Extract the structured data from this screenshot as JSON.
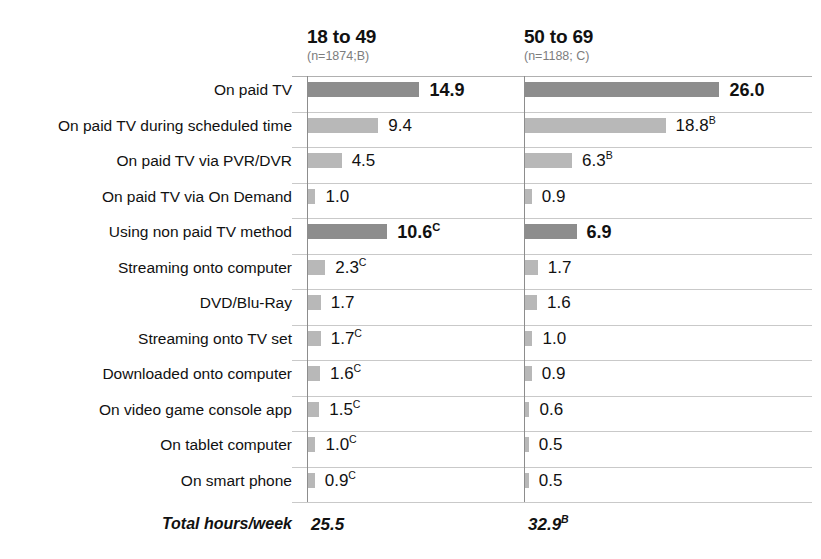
{
  "chart_data": {
    "type": "bar",
    "title": "",
    "subtitle": "",
    "xlabel": "",
    "ylabel": "",
    "orientation": "horizontal",
    "grid": true,
    "legend_position": "none",
    "xlim": [
      0,
      27
    ],
    "columns": [
      {
        "key": "B",
        "title": "18 to 49",
        "nsize": "(n=1874;B)"
      },
      {
        "key": "C",
        "title": "50 to 69",
        "nsize": "(n=1188; C)"
      }
    ],
    "categories": [
      "On paid TV",
      "On paid TV during scheduled time",
      "On paid TV via PVR/DVR",
      "On paid TV via On Demand",
      "Using non paid TV method",
      "Streaming onto computer",
      "DVD/Blu-Ray",
      "Streaming onto TV set",
      "Downloaded onto computer",
      "On video game console app",
      "On tablet computer",
      "On smart phone"
    ],
    "rows": [
      {
        "label": "On paid TV",
        "emphasis": true,
        "col1": {
          "value": 14.9,
          "text": "14.9",
          "sig": "",
          "bold": true,
          "shade": "dark"
        },
        "col2": {
          "value": 26.0,
          "text": "26.0",
          "sig": "",
          "bold": true,
          "shade": "dark"
        }
      },
      {
        "label": "On paid TV during scheduled time",
        "emphasis": false,
        "col1": {
          "value": 9.4,
          "text": "9.4",
          "sig": "",
          "bold": false,
          "shade": "light"
        },
        "col2": {
          "value": 18.8,
          "text": "18.8",
          "sig": "B",
          "bold": false,
          "shade": "light"
        }
      },
      {
        "label": "On paid TV via PVR/DVR",
        "emphasis": false,
        "col1": {
          "value": 4.5,
          "text": "4.5",
          "sig": "",
          "bold": false,
          "shade": "light"
        },
        "col2": {
          "value": 6.3,
          "text": "6.3",
          "sig": "B",
          "bold": false,
          "shade": "light"
        }
      },
      {
        "label": "On paid TV via On Demand",
        "emphasis": false,
        "col1": {
          "value": 1.0,
          "text": "1.0",
          "sig": "",
          "bold": false,
          "shade": "light"
        },
        "col2": {
          "value": 0.9,
          "text": "0.9",
          "sig": "",
          "bold": false,
          "shade": "light"
        }
      },
      {
        "label": "Using non paid TV method",
        "emphasis": true,
        "col1": {
          "value": 10.6,
          "text": "10.6",
          "sig": "C",
          "bold": true,
          "shade": "dark"
        },
        "col2": {
          "value": 6.9,
          "text": "6.9",
          "sig": "",
          "bold": true,
          "shade": "dark"
        }
      },
      {
        "label": "Streaming onto computer",
        "emphasis": false,
        "col1": {
          "value": 2.3,
          "text": "2.3",
          "sig": "C",
          "bold": false,
          "shade": "light"
        },
        "col2": {
          "value": 1.7,
          "text": "1.7",
          "sig": "",
          "bold": false,
          "shade": "light"
        }
      },
      {
        "label": "DVD/Blu-Ray",
        "emphasis": false,
        "col1": {
          "value": 1.7,
          "text": "1.7",
          "sig": "",
          "bold": false,
          "shade": "light"
        },
        "col2": {
          "value": 1.6,
          "text": "1.6",
          "sig": "",
          "bold": false,
          "shade": "light"
        }
      },
      {
        "label": "Streaming onto TV set",
        "emphasis": false,
        "col1": {
          "value": 1.7,
          "text": "1.7",
          "sig": "C",
          "bold": false,
          "shade": "light"
        },
        "col2": {
          "value": 1.0,
          "text": "1.0",
          "sig": "",
          "bold": false,
          "shade": "light"
        }
      },
      {
        "label": "Downloaded onto computer",
        "emphasis": false,
        "col1": {
          "value": 1.6,
          "text": "1.6",
          "sig": "C",
          "bold": false,
          "shade": "light"
        },
        "col2": {
          "value": 0.9,
          "text": "0.9",
          "sig": "",
          "bold": false,
          "shade": "light"
        }
      },
      {
        "label": "On video game console app",
        "emphasis": false,
        "col1": {
          "value": 1.5,
          "text": "1.5",
          "sig": "C",
          "bold": false,
          "shade": "light"
        },
        "col2": {
          "value": 0.6,
          "text": "0.6",
          "sig": "",
          "bold": false,
          "shade": "light"
        }
      },
      {
        "label": "On tablet computer",
        "emphasis": false,
        "col1": {
          "value": 1.0,
          "text": "1.0",
          "sig": "C",
          "bold": false,
          "shade": "light"
        },
        "col2": {
          "value": 0.5,
          "text": "0.5",
          "sig": "",
          "bold": false,
          "shade": "light"
        }
      },
      {
        "label": "On smart phone",
        "emphasis": false,
        "col1": {
          "value": 0.9,
          "text": "0.9",
          "sig": "C",
          "bold": false,
          "shade": "light"
        },
        "col2": {
          "value": 0.5,
          "text": "0.5",
          "sig": "",
          "bold": false,
          "shade": "light"
        }
      }
    ],
    "total": {
      "label": "Total hours/week",
      "col1": {
        "text": "25.5",
        "sig": ""
      },
      "col2": {
        "text": "32.9",
        "sig": "B"
      }
    },
    "series": [
      {
        "name": "18 to 49",
        "values": [
          14.9,
          9.4,
          4.5,
          1.0,
          10.6,
          2.3,
          1.7,
          1.7,
          1.6,
          1.5,
          1.0,
          0.9
        ]
      },
      {
        "name": "50 to 69",
        "values": [
          26.0,
          18.8,
          6.3,
          0.9,
          6.9,
          1.7,
          1.6,
          1.0,
          0.9,
          0.6,
          0.5,
          0.5
        ]
      }
    ],
    "colors": {
      "bar_dark": "#8d8d8d",
      "bar_light": "#b8b8b8",
      "gridline": "#c9c9c9",
      "baseline": "#8d8d8d",
      "text": "#111111",
      "nsize_text": "#7d7d7d"
    }
  }
}
